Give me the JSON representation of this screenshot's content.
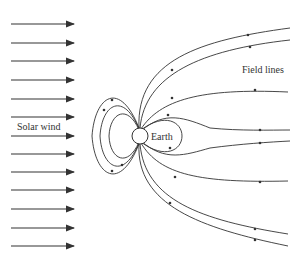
{
  "diagram": {
    "labels": {
      "solar_wind": "Solar wind",
      "earth": "Earth",
      "field_lines": "Field lines"
    },
    "colors": {
      "line": "#333333",
      "background": "#ffffff"
    },
    "solar_wind_arrows_y": [
      24,
      43,
      61,
      80,
      99,
      117,
      136,
      154,
      172,
      190,
      209,
      228,
      246
    ],
    "earth": {
      "cx": 140,
      "cy": 136,
      "r": 8
    }
  }
}
